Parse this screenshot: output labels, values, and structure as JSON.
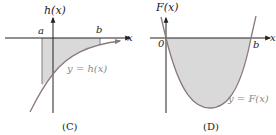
{
  "panels": [
    {
      "id": "C",
      "caption": "(C)",
      "y_axis_label": "h(x)",
      "x_axis_label": "x",
      "tick_a": "a",
      "tick_b": "b",
      "curve_label": "y = h(x)"
    },
    {
      "id": "D",
      "caption": "(D)",
      "y_axis_label": "F(x)",
      "x_axis_label": "x",
      "tick_zero": "0",
      "tick_b": "b",
      "curve_label": "y = F(x)"
    }
  ],
  "colors": {
    "axis": "#222222",
    "curve": "#8a7a7a",
    "shade": "#d9d9d9",
    "label_gray": "#888888"
  }
}
